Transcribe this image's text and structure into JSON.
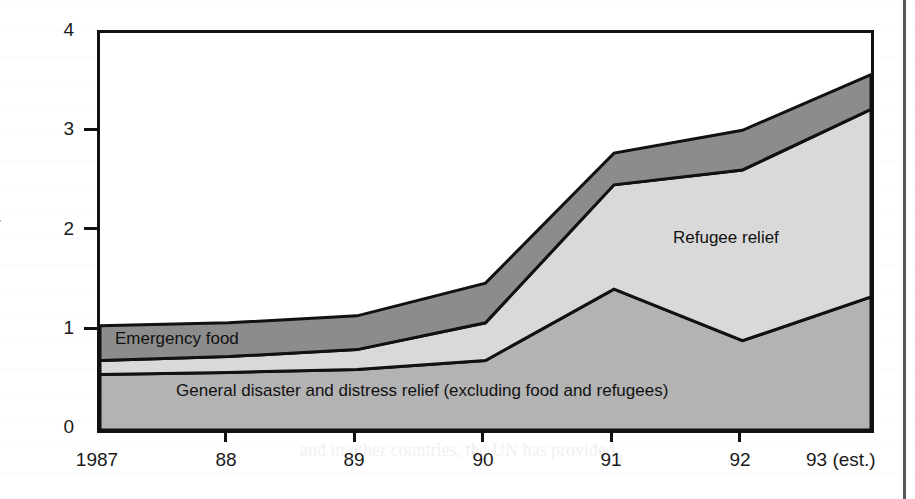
{
  "figure": {
    "title": "",
    "background_color": "#ffffff",
    "frame_color": "#111111"
  },
  "axes": {
    "ylabel": "$ billion",
    "y_ticks": [
      "0",
      "1",
      "2",
      "3",
      "4"
    ],
    "x_ticks": [
      "1987",
      "88",
      "89",
      "90",
      "91",
      "92",
      "93 (est.)"
    ]
  },
  "series_labels": {
    "emergency_food": "Emergency food",
    "refugee_relief": "Refugee relief",
    "general_relief": "General disaster and distress relief (excluding food and refugees)"
  },
  "colors": {
    "general_relief": "#b3b3b3",
    "refugee_relief": "#d9d9d9",
    "emergency_food": "#8c8c8c",
    "outline": "#111111",
    "text": "#1a1a1a"
  },
  "chart_data": {
    "type": "area",
    "stacked": true,
    "title": "",
    "xlabel": "",
    "ylabel": "$ billion",
    "x": [
      "1987",
      "88",
      "89",
      "90",
      "91",
      "92",
      "93 (est.)"
    ],
    "ylim": [
      0,
      4
    ],
    "xlim": [
      "1987",
      "93 (est.)"
    ],
    "grid": false,
    "legend": "inline-labels",
    "units": "US$ billion",
    "series": [
      {
        "name": "General disaster and distress relief (excluding food and refugees)",
        "color": "#b3b3b3",
        "stack_order": 1,
        "values": [
          0.56,
          0.58,
          0.61,
          0.7,
          1.42,
          0.9,
          1.34
        ]
      },
      {
        "name": "Refugee relief",
        "color": "#d9d9d9",
        "stack_order": 2,
        "values": [
          0.14,
          0.16,
          0.2,
          0.38,
          1.05,
          1.72,
          1.89
        ]
      },
      {
        "name": "Emergency food",
        "color": "#8c8c8c",
        "stack_order": 3,
        "values": [
          0.35,
          0.34,
          0.34,
          0.4,
          0.32,
          0.4,
          0.35
        ]
      }
    ],
    "cumulative_tops": {
      "general_relief": [
        0.56,
        0.58,
        0.61,
        0.7,
        1.42,
        0.9,
        1.34
      ],
      "plus_refugee": [
        0.7,
        0.74,
        0.81,
        1.08,
        2.47,
        2.62,
        3.23
      ],
      "plus_emergency_food": [
        1.05,
        1.08,
        1.15,
        1.48,
        2.79,
        3.02,
        3.58
      ]
    }
  }
}
